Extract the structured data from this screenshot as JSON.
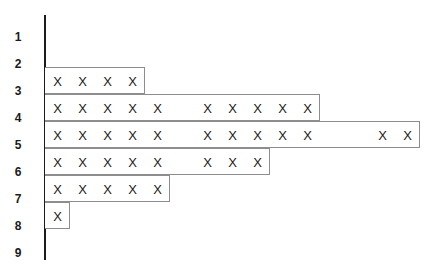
{
  "chart_data": {
    "type": "bar",
    "title": "",
    "subtitle": "",
    "xlabel": "",
    "ylabel": "",
    "grid": false,
    "legend": null,
    "orientation": "horizontal",
    "marker": "X",
    "marker_note": "Each X mark represents one unit; bar length may exceed the number of X marks, leaving blank cells",
    "categories": [
      "1",
      "2",
      "3",
      "4",
      "5",
      "6",
      "7",
      "8",
      "9"
    ],
    "values": [
      0,
      0,
      4,
      10,
      12,
      8,
      5,
      1,
      0
    ],
    "bar_lengths_cells": [
      0,
      0,
      4,
      11,
      15,
      9,
      5,
      1,
      0
    ],
    "xlim": [
      0,
      15
    ],
    "ylim_categories": [
      "1",
      "9"
    ],
    "rows": [
      {
        "label": "1",
        "count": 0,
        "bar_cells": 0,
        "marks": []
      },
      {
        "label": "2",
        "count": 0,
        "bar_cells": 0,
        "marks": []
      },
      {
        "label": "3",
        "count": 4,
        "bar_cells": 4,
        "marks": [
          1,
          1,
          1,
          1
        ]
      },
      {
        "label": "4",
        "count": 10,
        "bar_cells": 11,
        "marks": [
          1,
          1,
          1,
          1,
          1,
          0,
          1,
          1,
          1,
          1,
          1
        ]
      },
      {
        "label": "5",
        "count": 12,
        "bar_cells": 15,
        "marks": [
          1,
          1,
          1,
          1,
          1,
          0,
          1,
          1,
          1,
          1,
          1,
          0,
          0,
          1,
          1
        ]
      },
      {
        "label": "6",
        "count": 8,
        "bar_cells": 9,
        "marks": [
          1,
          1,
          1,
          1,
          1,
          0,
          1,
          1,
          1
        ]
      },
      {
        "label": "7",
        "count": 5,
        "bar_cells": 5,
        "marks": [
          1,
          1,
          1,
          1,
          1
        ]
      },
      {
        "label": "8",
        "count": 1,
        "bar_cells": 1,
        "marks": [
          1
        ]
      },
      {
        "label": "9",
        "count": 0,
        "bar_cells": 0,
        "marks": []
      }
    ],
    "colors": {
      "axis": "#1b1b1b",
      "bar_border": "#8d8d8d",
      "bar_fill": "#ffffff",
      "mark": "#1b1b1b",
      "background": "#ffffff"
    }
  },
  "axis": {
    "ticks": [
      "1",
      "2",
      "3",
      "4",
      "5",
      "6",
      "7",
      "8",
      "9"
    ]
  },
  "marks": {
    "glyph": "X"
  }
}
